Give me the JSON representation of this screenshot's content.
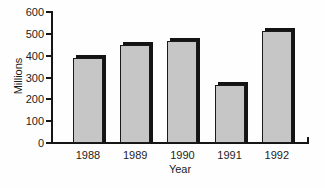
{
  "chart_data": {
    "type": "bar",
    "categories": [
      "1988",
      "1989",
      "1990",
      "1991",
      "1992"
    ],
    "values": [
      390,
      450,
      465,
      265,
      515
    ],
    "title": "",
    "xlabel": "Year",
    "ylabel": "Millions",
    "ylim": [
      0,
      600
    ],
    "yticks": [
      0,
      100,
      200,
      300,
      400,
      500,
      600
    ],
    "grid": false,
    "legend": false,
    "bar_color": "#c6c6c6",
    "bar_outline_color": "#1a1a1a",
    "bar_shadow_color": "#141414",
    "axis_color": "#161616",
    "text_color": "#1c1c1c",
    "background_color": "#fefefe"
  }
}
